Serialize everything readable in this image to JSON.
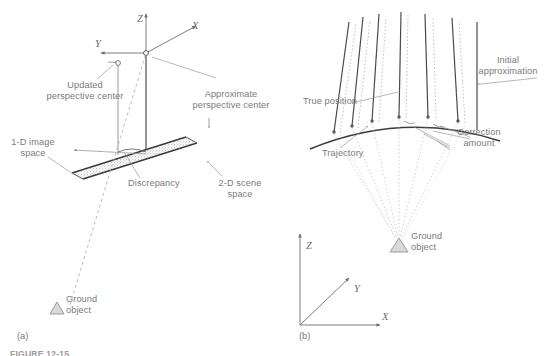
{
  "figure": {
    "caption_partial": "FIGURE 12-15",
    "panel_a_label": "(a)",
    "panel_b_label": "(b)"
  },
  "panel_a": {
    "axes": [
      {
        "name": "z-axis-label",
        "text": "Z"
      },
      {
        "name": "x-axis-label",
        "text": "X"
      },
      {
        "name": "y-axis-label",
        "text": "Y"
      }
    ],
    "labels": {
      "updated_perspective_center": "Updated\nperspective center",
      "updated_perspective_center_line1": "Updated",
      "updated_perspective_center_line2": "perspective center",
      "approximate_perspective_center_line1": "Approximate",
      "approximate_perspective_center_line2": "perspective center",
      "image_space_line1": "1-D image",
      "image_space_line2": "space",
      "scene_space_line1": "2-D scene",
      "scene_space_line2": "space",
      "discrepancy": "Discrepancy",
      "ground_object_line1": "Ground",
      "ground_object_line2": "object"
    }
  },
  "panel_b": {
    "axes": [
      {
        "name": "z-axis-label",
        "text": "Z"
      },
      {
        "name": "y-axis-label",
        "text": "Y"
      },
      {
        "name": "x-axis-label",
        "text": "X"
      }
    ],
    "labels": {
      "true_position": "True position",
      "initial_approximation_line1": "Initial",
      "initial_approximation_line2": "approximation",
      "trajectory": "Trajectory",
      "correction_amount_line1": "Correction",
      "correction_amount_line2": "amount",
      "ground_object_line1": "Ground",
      "ground_object_line2": "object"
    }
  },
  "colors": {
    "ink_dark": "#4a4a4a",
    "ink_mid": "#7a7a7a",
    "ink_light": "#a8a8a8",
    "hatch": "#9b9b9b",
    "background": "#ffffff"
  }
}
